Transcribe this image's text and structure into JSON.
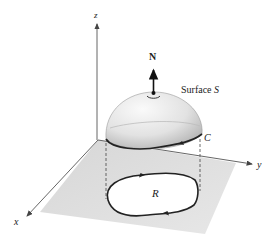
{
  "figure": {
    "labels": {
      "z_axis": "z",
      "x_axis": "x",
      "y_axis": "y",
      "normal_vector": "N",
      "surface": "Surface S",
      "curve": "C",
      "region": "R"
    },
    "colors": {
      "plane": "#d4d4d4",
      "axis": "#555555",
      "curve": "#222222",
      "surface_light": "#f2f2f2",
      "surface_dark": "#a8a8a8"
    }
  }
}
